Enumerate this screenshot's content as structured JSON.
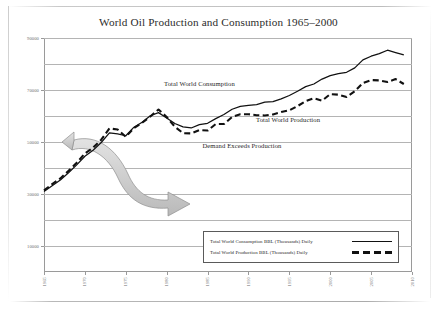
{
  "chart_title": "World Oil Production and Consumption 1965–2000",
  "annotations": {
    "consumption_label": "Total World Consumption",
    "production_label": "Total World Production",
    "demand_label": "Demand Exceeds Production"
  },
  "legend": {
    "consumption": "Total World Consumption BBL (Thousands) Daily",
    "production": "Total World Production BBL (Thousands) Daily"
  },
  "chart_data": {
    "type": "line",
    "title": "World Oil Production and Consumption 1965–2000",
    "xlabel": "",
    "ylabel": "",
    "xlim": [
      1965,
      2010
    ],
    "ylim": [
      0,
      90000
    ],
    "grid": true,
    "legend_position": "inside-bottom-right",
    "ytick_labels": [
      "90000",
      "70000",
      "50000",
      "30000",
      "10000"
    ],
    "ytick_values": [
      90000,
      70000,
      50000,
      30000,
      10000
    ],
    "gridline_values": [
      90000,
      80000,
      70000,
      60000,
      50000,
      40000,
      30000,
      20000,
      10000
    ],
    "xtick_labels": [
      "1965",
      "1970",
      "1975",
      "1980",
      "1985",
      "1990",
      "1995",
      "2000",
      "2005",
      "2010"
    ],
    "xtick_values": [
      1965,
      1970,
      1975,
      1980,
      1985,
      1990,
      1995,
      2000,
      2005,
      2010
    ],
    "x": [
      1965,
      1966,
      1967,
      1968,
      1969,
      1970,
      1971,
      1972,
      1973,
      1974,
      1975,
      1976,
      1977,
      1978,
      1979,
      1980,
      1981,
      1982,
      1983,
      1984,
      1985,
      1986,
      1987,
      1988,
      1989,
      1990,
      1991,
      1992,
      1993,
      1994,
      1995,
      1996,
      1997,
      1998,
      1999,
      2000,
      2001,
      2002,
      2003,
      2004,
      2005,
      2006,
      2007,
      2008,
      2009
    ],
    "series": [
      {
        "name": "Total World Consumption BBL (Thousands) Daily",
        "style": "solid",
        "color": "#111111",
        "values": [
          31000,
          33200,
          35400,
          38200,
          41200,
          44500,
          46800,
          49800,
          53500,
          53100,
          52400,
          55700,
          57600,
          60100,
          61300,
          59200,
          57100,
          55800,
          55400,
          56700,
          57200,
          59000,
          60600,
          62600,
          63700,
          64100,
          64400,
          65300,
          65500,
          66600,
          67900,
          69500,
          71300,
          72300,
          74200,
          75500,
          76300,
          76800,
          78500,
          81600,
          83000,
          84000,
          85300,
          84400,
          83500
        ]
      },
      {
        "name": "Total World Production BBL (Thousands) Daily",
        "style": "dashed",
        "color": "#111111",
        "values": [
          31400,
          33800,
          36000,
          38900,
          42000,
          45600,
          47800,
          50900,
          55200,
          54800,
          52000,
          55400,
          57400,
          59800,
          62500,
          59600,
          55900,
          53400,
          53300,
          54600,
          54400,
          56900,
          56900,
          59600,
          60700,
          60700,
          60300,
          60200,
          60600,
          61500,
          62200,
          63800,
          65700,
          66800,
          65900,
          68400,
          68200,
          67300,
          69500,
          72700,
          73800,
          73700,
          73100,
          74200,
          72300
        ]
      }
    ]
  }
}
